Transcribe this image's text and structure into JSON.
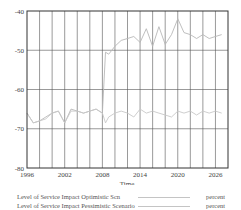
{
  "chart_data": {
    "type": "line",
    "title": "",
    "xlabel": "Time",
    "ylabel": "",
    "xlim": [
      1996,
      2028
    ],
    "ylim": [
      -80,
      -40
    ],
    "grid": true,
    "x_ticks": [
      "1996",
      "2002",
      "2008",
      "2014",
      "2020",
      "2026"
    ],
    "y_ticks": [
      "-40",
      "-50",
      "-60",
      "-70",
      "-80"
    ],
    "x": [
      1996,
      1997,
      1998,
      1999,
      2000,
      2001,
      2002,
      2003,
      2004,
      2005,
      2006,
      2007,
      2008,
      2008.5,
      2009,
      2010,
      2011,
      2012,
      2013,
      2014,
      2015,
      2016,
      2017,
      2018,
      2019,
      2020,
      2021,
      2022,
      2023,
      2024,
      2025,
      2026,
      2027
    ],
    "series": [
      {
        "name": "Level of Service Impact Optimistic Scn",
        "unit": "percent",
        "color": "#b8b8b8",
        "values": [
          -66,
          -68.5,
          -68,
          -67,
          -66,
          -65.5,
          -68.5,
          -65,
          -65.5,
          -66,
          -65.5,
          -65,
          -66,
          -50.5,
          -51,
          -49,
          -47.5,
          -47,
          -46.5,
          -48,
          -44.5,
          -49,
          -44,
          -48.5,
          -46,
          -42,
          -45.5,
          -46,
          -47,
          -46,
          -47,
          -46.5,
          -46
        ]
      },
      {
        "name": "Level of Service Impact Pessimistic Scenario",
        "unit": "percent",
        "color": "#c8c8c8",
        "values": [
          -66,
          -68.5,
          -68,
          -67.5,
          -66,
          -65.5,
          -68.5,
          -65.5,
          -65.5,
          -66,
          -65.5,
          -65,
          -66,
          -68.5,
          -67,
          -66,
          -65.5,
          -66,
          -67,
          -65,
          -66,
          -65.5,
          -66,
          -66.5,
          -67,
          -65.5,
          -66,
          -65.5,
          -66.5,
          -65.5,
          -66,
          -65.5,
          -66
        ]
      }
    ],
    "legend_position": "bottom"
  },
  "legend": {
    "items": [
      {
        "name": "Level of Service Impact Optimistic Scn",
        "unit": "percent"
      },
      {
        "name": "Level of Service Impact Pessimistic Scenario",
        "unit": "percent"
      }
    ]
  }
}
